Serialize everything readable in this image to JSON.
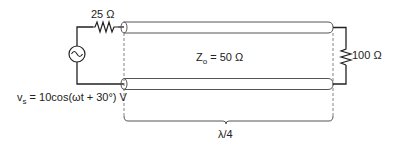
{
  "diagram": {
    "type": "transmission-line-circuit",
    "source": {
      "label_prefix": "v",
      "label_subscript": "s",
      "label_expression": " = 10cos(ωt + 30°) V",
      "icon": "ac-voltage-source-icon"
    },
    "source_resistor": {
      "label": "25 Ω"
    },
    "transmission_line": {
      "impedance_symbol": "Z",
      "impedance_subscript": "o",
      "impedance_value": " = 50 Ω"
    },
    "load_resistor": {
      "label": "100 Ω"
    },
    "length": {
      "label": "λ/4"
    },
    "colors": {
      "line": "#222222",
      "tube": "#555555",
      "dash": "#777777"
    }
  }
}
